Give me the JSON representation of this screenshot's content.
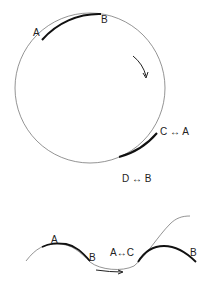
{
  "circle_diagram": {
    "labels": {
      "a": "A",
      "b": "B",
      "c_a": "C ↔ A",
      "d_b": "D ↔ B"
    },
    "arrow": "rotation-direction-clockwise"
  },
  "wave_diagram": {
    "labels": {
      "a": "A",
      "b_left": "B",
      "a_c": "A↔C",
      "b_right": "B"
    },
    "arrow": "direction-right"
  },
  "colors": {
    "line": "#555555",
    "thick_line": "#111111",
    "text": "#222222"
  }
}
